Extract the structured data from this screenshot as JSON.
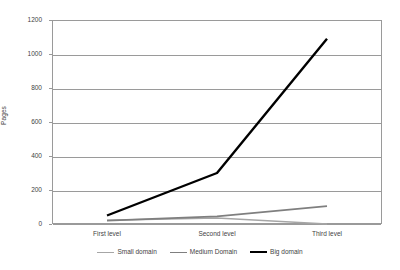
{
  "chart_data": {
    "type": "line",
    "title": "",
    "subtitle": "",
    "xlabel": "",
    "ylabel": "Pages",
    "categories": [
      "First level",
      "Second level",
      "Third level"
    ],
    "series": [
      {
        "name": "Small domain",
        "values": [
          22,
          35,
          0
        ],
        "color": "#a6a6a6",
        "width": 1.4
      },
      {
        "name": "Medium Domain",
        "values": [
          20,
          45,
          105
        ],
        "color": "#7f7f7f",
        "width": 1.6
      },
      {
        "name": "Big domain",
        "values": [
          50,
          300,
          1090
        ],
        "color": "#000000",
        "width": 2.4
      }
    ],
    "ylim": [
      0,
      1200
    ],
    "ytick_step": 200,
    "yticks": [
      0,
      200,
      400,
      600,
      800,
      1000,
      1200
    ],
    "ytick_labels": [
      "0",
      "200",
      "400",
      "600",
      "800",
      "1000",
      "1200"
    ],
    "grid": true,
    "grid_axis": "y",
    "legend_position": "bottom",
    "plot_border": true,
    "axis_color": "#9a9a9a",
    "text_color": "#3f3f3f",
    "background": "#ffffff"
  }
}
